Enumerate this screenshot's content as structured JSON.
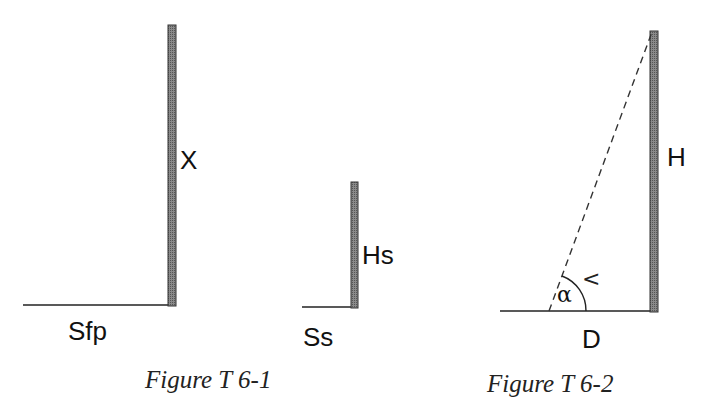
{
  "colors": {
    "background": "#ffffff",
    "line": "#222222",
    "wall_fill": "#7a7a7a",
    "wall_border": "#333333",
    "text": "#111111"
  },
  "figure_1": {
    "caption": "Figure T 6-1",
    "tall_wall": {
      "height_label": "X",
      "ground_label": "Sfp"
    },
    "short_wall": {
      "height_label": "Hs",
      "ground_label": "Ss"
    }
  },
  "figure_2": {
    "caption": "Figure T 6-2",
    "wall": {
      "height_label": "H",
      "distance_label": "D"
    },
    "angle_label": "α",
    "angle_marker": "<",
    "sightline": "dashed"
  }
}
